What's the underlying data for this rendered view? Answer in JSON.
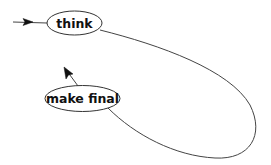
{
  "diagram": {
    "type": "state-machine",
    "nodes": [
      {
        "id": "think",
        "label": "think"
      },
      {
        "id": "make_final",
        "label": "make final"
      }
    ],
    "edges": [
      {
        "from": "start",
        "to": "think",
        "kind": "initial-arrow"
      },
      {
        "from": "think",
        "to": "make_final",
        "kind": "loop-curve"
      },
      {
        "from": "make_final",
        "to": "exit",
        "kind": "outgoing-arrow"
      }
    ]
  }
}
